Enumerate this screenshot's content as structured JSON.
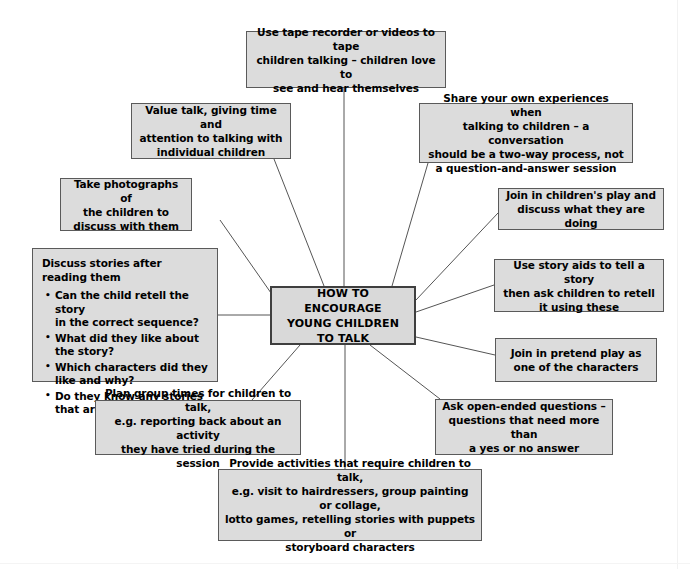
{
  "diagram": {
    "title": "HOW TO ENCOURAGE YOUNG CHILDREN TO TALK",
    "center": {
      "label": "HOW TO ENCOURAGE\nYOUNG CHILDREN\nTO TALK"
    },
    "colors": {
      "node_fill": "#dcdcdc",
      "node_border": "#5a5a5a",
      "center_border": "#3f3f3f",
      "connector": "#555555",
      "text": "#000000",
      "background": "#ffffff"
    },
    "nodes": [
      {
        "id": "tape-recorder",
        "label": "Use tape recorder or videos to tape\nchildren talking – children love to\nsee and hear themselves"
      },
      {
        "id": "value-talk",
        "label": "Value talk, giving time and\nattention to talking with\nindividual children"
      },
      {
        "id": "take-photographs",
        "label": "Take photographs of\nthe children to\ndiscuss with them"
      },
      {
        "id": "discuss-stories",
        "heading": "Discuss stories after reading them",
        "bullets": [
          "Can the child retell the story\nin the correct sequence?",
          "What did they like about\nthe story?",
          "Which characters did they\nlike and why?",
          "Do they know any stories\nthat are similar?"
        ]
      },
      {
        "id": "share-experiences",
        "label": "Share your own experiences when\ntalking to children – a conversation\nshould be a two-way process, not\na question-and-answer session"
      },
      {
        "id": "join-childrens-play",
        "label": "Join in children's play and\ndiscuss what they are doing"
      },
      {
        "id": "story-aids",
        "label": "Use story aids to tell a story\nthen ask children to retell\nit using these"
      },
      {
        "id": "pretend-play",
        "label": "Join in pretend play as\none of the characters"
      },
      {
        "id": "open-ended-questions",
        "label": "Ask open-ended questions –\nquestions that need more than\na yes or no answer"
      },
      {
        "id": "plan-group-times",
        "label": "Plan group times for children to talk,\ne.g. reporting back about an activity\nthey have tried during the session"
      },
      {
        "id": "provide-activities",
        "label": "Provide activities that require children to talk,\ne.g. visit to hairdressers, group painting or collage,\nlotto games, retelling stories with puppets or\nstoryboard characters"
      }
    ]
  }
}
